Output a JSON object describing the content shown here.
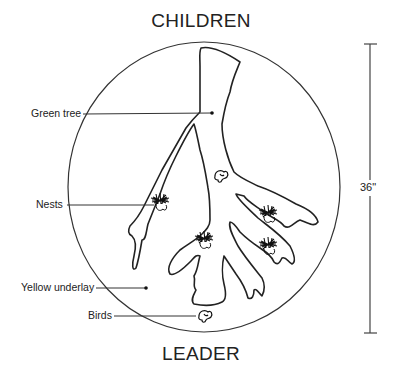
{
  "diagram": {
    "top_label": "CHILDREN",
    "bottom_label": "LEADER",
    "dimension_label": "36\"",
    "callouts": [
      {
        "label": "Green tree"
      },
      {
        "label": "Nests"
      },
      {
        "label": "Yellow underlay"
      },
      {
        "label": "Birds"
      }
    ]
  }
}
